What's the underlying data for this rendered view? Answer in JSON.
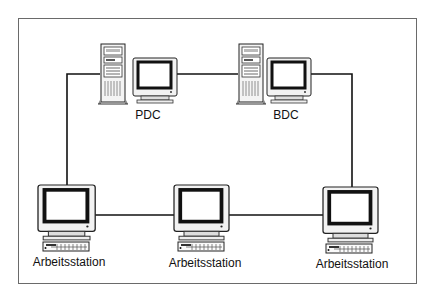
{
  "diagram": {
    "type": "network-topology",
    "nodes": [
      {
        "id": "pdc",
        "label": "PDC",
        "kind": "server-with-monitor"
      },
      {
        "id": "bdc",
        "label": "BDC",
        "kind": "server-with-monitor"
      },
      {
        "id": "ws1",
        "label": "Arbeitsstation",
        "kind": "workstation"
      },
      {
        "id": "ws2",
        "label": "Arbeitsstation",
        "kind": "workstation"
      },
      {
        "id": "ws3",
        "label": "Arbeitsstation",
        "kind": "workstation"
      }
    ],
    "edges": [
      {
        "from": "pdc",
        "to": "bdc"
      },
      {
        "from": "bdc",
        "to": "ws3"
      },
      {
        "from": "ws3",
        "to": "ws2"
      },
      {
        "from": "ws2",
        "to": "ws1"
      },
      {
        "from": "ws1",
        "to": "pdc"
      }
    ],
    "colors": {
      "line": "#111111",
      "frame": "#6a6a6a",
      "screen": "#ffffff",
      "bezel": "#111111"
    }
  }
}
